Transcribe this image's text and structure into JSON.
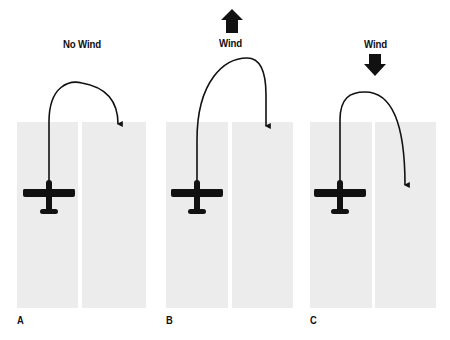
{
  "diagram": {
    "colors": {
      "runway": "#ececec",
      "ink": "#111111",
      "background": "#ffffff"
    },
    "panels": [
      {
        "id": "A",
        "label": "A",
        "title": "No Wind",
        "wind_arrow": "none"
      },
      {
        "id": "B",
        "label": "B",
        "title": "Wind",
        "wind_arrow": "up"
      },
      {
        "id": "C",
        "label": "C",
        "title": "Wind",
        "wind_arrow": "down"
      }
    ]
  }
}
